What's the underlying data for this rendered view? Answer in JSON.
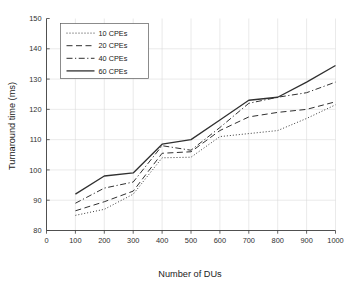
{
  "chart_data": {
    "type": "line",
    "title": "",
    "xlabel": "Number of DUs",
    "ylabel": "Turnaround time (ms)",
    "xlim": [
      0,
      1000
    ],
    "ylim": [
      80,
      150
    ],
    "xticks": [
      0,
      100,
      200,
      300,
      400,
      500,
      600,
      700,
      800,
      900,
      1000
    ],
    "yticks": [
      80,
      90,
      100,
      110,
      120,
      130,
      140,
      150
    ],
    "xticklabels": [
      "0",
      "100",
      "200",
      "300",
      "400",
      "500",
      "600",
      "700",
      "800",
      "900",
      "1000"
    ],
    "yticklabels": [
      "80",
      "90",
      "100",
      "110",
      "120",
      "130",
      "140",
      "150"
    ],
    "grid": true,
    "legend_position": "upper left",
    "x": [
      100,
      200,
      300,
      400,
      500,
      600,
      700,
      800,
      900,
      1000
    ],
    "series": [
      {
        "name": "10 CPEs",
        "linestyle": "dotted",
        "dasharray": "1,2",
        "width": 0.95,
        "color": "#303030",
        "values": [
          85.0,
          87.0,
          92.0,
          104.0,
          104.2,
          111.0,
          112.0,
          113.0,
          117.0,
          121.5
        ]
      },
      {
        "name": "20 CPEs",
        "linestyle": "dashed",
        "dasharray": "6,3.5",
        "width": 1.0,
        "color": "#303030",
        "values": [
          86.5,
          89.5,
          93.0,
          105.5,
          106.0,
          113.0,
          117.5,
          119.0,
          120.0,
          122.5
        ]
      },
      {
        "name": "40 CPEs",
        "linestyle": "dashdot",
        "dasharray": "6,2.5,1.2,2.5",
        "width": 1.0,
        "color": "#303030",
        "values": [
          89.0,
          94.0,
          96.0,
          108.0,
          106.5,
          114.0,
          122.0,
          124.0,
          125.5,
          129.0
        ]
      },
      {
        "name": "60 CPEs",
        "linestyle": "solid",
        "dasharray": "",
        "width": 1.3,
        "color": "#303030",
        "values": [
          92.0,
          98.0,
          99.0,
          108.5,
          110.0,
          116.5,
          123.0,
          124.0,
          129.0,
          134.5
        ]
      }
    ]
  }
}
